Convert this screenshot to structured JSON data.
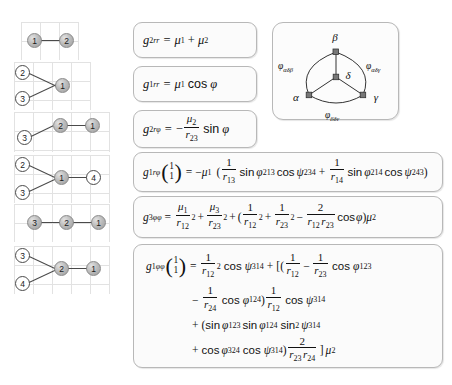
{
  "figure": {
    "graphs": [
      {
        "id": "graph-1",
        "nodes": [
          {
            "label": "1",
            "style": "filled"
          },
          {
            "label": "2",
            "style": "filled"
          }
        ]
      },
      {
        "id": "graph-2",
        "nodes": [
          {
            "label": "2",
            "style": "open"
          },
          {
            "label": "3",
            "style": "open"
          },
          {
            "label": "1",
            "style": "filled"
          }
        ]
      },
      {
        "id": "graph-3",
        "nodes": [
          {
            "label": "3",
            "style": "open"
          },
          {
            "label": "2",
            "style": "filled"
          },
          {
            "label": "1",
            "style": "filled"
          }
        ]
      },
      {
        "id": "graph-4",
        "nodes": [
          {
            "label": "2",
            "style": "open"
          },
          {
            "label": "3",
            "style": "open"
          },
          {
            "label": "1",
            "style": "filled"
          },
          {
            "label": "4",
            "style": "open"
          }
        ]
      },
      {
        "id": "graph-5",
        "nodes": [
          {
            "label": "3",
            "style": "filled"
          },
          {
            "label": "2",
            "style": "filled"
          },
          {
            "label": "1",
            "style": "filled"
          }
        ]
      },
      {
        "id": "graph-6",
        "nodes": [
          {
            "label": "3",
            "style": "open"
          },
          {
            "label": "4",
            "style": "open"
          },
          {
            "label": "2",
            "style": "filled"
          },
          {
            "label": "1",
            "style": "filled"
          }
        ]
      }
    ],
    "triangle": {
      "vertex_top": "β",
      "vertex_left": "α",
      "vertex_right": "γ",
      "vertex_center": "δ",
      "angle_left": {
        "base": "φ",
        "sub": "αδβ"
      },
      "angle_right": {
        "base": "φ",
        "sub": "αδγ"
      },
      "angle_bottom": {
        "base": "φ",
        "sub": "βδγ"
      }
    },
    "formulas": {
      "f1": {
        "lhs_base": "g",
        "lhs_sup": "2",
        "lhs_sub": "rr",
        "eq": "=",
        "terms": [
          "μ",
          "1",
          "+",
          "μ",
          "2"
        ]
      },
      "f2": {
        "lhs_base": "g",
        "lhs_sup": "1",
        "lhs_sub": "rr",
        "eq": "=",
        "mu": "μ",
        "mu_sub": "1",
        "fn": "cos",
        "arg": "φ"
      },
      "f3": {
        "lhs_base": "g",
        "lhs_sup": "2",
        "lhs_sub": "rφ",
        "eq": "=",
        "sign": "−",
        "num": "μ",
        "num_sub": "2",
        "den": "r",
        "den_sub": "23",
        "fn": "sin",
        "arg": "φ"
      },
      "f4": {
        "lhs_base": "g",
        "lhs_sup": "1",
        "lhs_sub": "rφ",
        "vec_top": "1",
        "vec_bottom": "1",
        "eq": "=",
        "sign": "−",
        "mu": "μ",
        "mu_sub": "1",
        "open_paren": "(",
        "t1_num": "1",
        "t1_den": "r",
        "t1_den_sub": "13",
        "t1_sin": "sin",
        "t1_phi": "φ",
        "t1_phi_sub": "213",
        "t1_cos": "cos",
        "t1_psi": "ψ",
        "t1_psi_sub": "234",
        "plus": "+",
        "t2_num": "1",
        "t2_den": "r",
        "t2_den_sub": "14",
        "t2_sin": "sin",
        "t2_phi": "φ",
        "t2_phi_sub": "214",
        "t2_cos": "cos",
        "t2_psi": "ψ",
        "t2_psi_sub": "243",
        "close_paren": ")"
      },
      "f5": {
        "lhs_base": "g",
        "lhs_sup": "3",
        "lhs_sub": "φφ",
        "eq": "=",
        "a_num": "μ",
        "a_num_sub": "1",
        "a_den": "r",
        "a_den_sub": "12",
        "a_pow": "2",
        "plus1": "+",
        "b_num": "μ",
        "b_num_sub": "3",
        "b_den": "r",
        "b_den_sub": "23",
        "b_pow": "2",
        "plus2": "+",
        "open_paren": "(",
        "c_num": "1",
        "c_den": "r",
        "c_den_sub": "12",
        "c_pow": "2",
        "plus3": "+",
        "d_num": "1",
        "d_den": "r",
        "d_den_sub": "23",
        "d_pow": "2",
        "minus": "−",
        "e_num": "2",
        "e_den1": "r",
        "e_den1_sub": "12",
        "e_den2": "r",
        "e_den2_sub": "23",
        "cos": "cos",
        "phi": "φ",
        "close_paren": ")",
        "mu": "μ",
        "mu_sub": "2"
      },
      "f6": {
        "lhs_base": "g",
        "lhs_sup": "1",
        "lhs_sub": "φφ",
        "vec_top": "1",
        "vec_bottom": "1",
        "eq": "=",
        "line1": {
          "a_num": "1",
          "a_den": "r",
          "a_den_sub": "12",
          "a_pow": "2",
          "cos1": "cos",
          "psi1": "ψ",
          "psi1_sub": "314",
          "plus": "+",
          "bracket": "[(",
          "b_num": "1",
          "b_den": "r",
          "b_den_sub": "12",
          "minus": "−",
          "c_num": "1",
          "c_den": "r",
          "c_den_sub": "23",
          "cos2": "cos",
          "phi1": "φ",
          "phi1_sub": "123"
        },
        "line2": {
          "minus": "−",
          "a_num": "1",
          "a_den": "r",
          "a_den_sub": "24",
          "cos1": "cos",
          "phi": "φ",
          "phi_sub": "124",
          "close_paren": ")",
          "b_num": "1",
          "b_den": "r",
          "b_den_sub": "12",
          "cos2": "cos",
          "psi": "ψ",
          "psi_sub": "314"
        },
        "line3": {
          "plus": "+",
          "open_paren": "(",
          "sin1": "sin",
          "phi1": "φ",
          "phi1_sub": "123",
          "sin2": "sin",
          "phi2": "φ",
          "phi2_sub": "124",
          "sin3": "sin",
          "sin3_pow": "2",
          "psi": "ψ",
          "psi_sub": "314"
        },
        "line4": {
          "plus": "+",
          "cos1": "cos",
          "phi": "φ",
          "phi_sub": "324",
          "cos2": "cos",
          "psi": "ψ",
          "psi_sub": "314",
          "close_paren": ")",
          "num": "2",
          "den1": "r",
          "den1_sub": "23",
          "den2": "r",
          "den2_sub": "24",
          "close_bracket": "]",
          "mu": "μ",
          "mu_sub": "2"
        }
      }
    }
  }
}
